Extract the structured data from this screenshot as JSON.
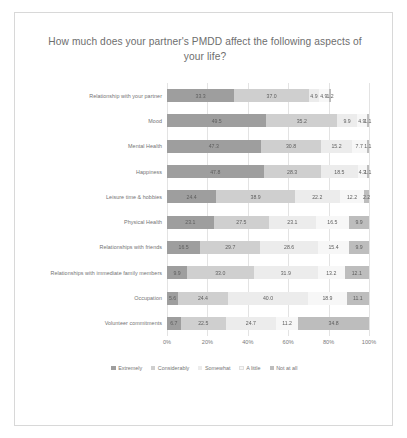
{
  "chart_data": {
    "type": "bar",
    "subtype": "100% stacked horizontal bar",
    "title": "How much does your partner's PMDD affect the following aspects of your life?",
    "xlabel": "",
    "ylabel": "",
    "xlim": [
      0,
      100
    ],
    "xticks": [
      "0%",
      "20%",
      "40%",
      "60%",
      "80%",
      "100%"
    ],
    "xtick_values": [
      0,
      20,
      40,
      60,
      80,
      100
    ],
    "grid": true,
    "legend_position": "bottom",
    "legend": [
      "Extremely",
      "Considerably",
      "Somewhat",
      "A little",
      "Not at all"
    ],
    "categories": [
      "Relationship with your partner",
      "Mood",
      "Mental Health",
      "Happiness",
      "Leisure time & hobbies",
      "Physical Health",
      "Relationships with friends",
      "Relationships with immediate family members",
      "Occupation",
      "Volunteer commitments"
    ],
    "series": [
      {
        "name": "Extremely",
        "color": "#9e9e9e",
        "values": [
          33.3,
          49.5,
          47.3,
          47.8,
          24.4,
          23.1,
          16.5,
          9.9,
          5.6,
          6.7
        ]
      },
      {
        "name": "Considerably",
        "color": "#cfcfcf",
        "values": [
          37.0,
          35.2,
          30.8,
          28.3,
          38.9,
          27.5,
          29.7,
          33.0,
          24.4,
          22.5
        ]
      },
      {
        "name": "Somewhat",
        "color": "#ececec",
        "values": [
          4.9,
          9.9,
          15.2,
          18.5,
          22.2,
          23.1,
          28.6,
          31.9,
          40.0,
          24.7
        ]
      },
      {
        "name": "A little",
        "color": "#f7f7f7",
        "values": [
          4.9,
          4.9,
          7.7,
          4.3,
          12.2,
          16.5,
          15.4,
          13.2,
          18.9,
          11.2
        ]
      },
      {
        "name": "Not at all",
        "color": "#bdbdbd",
        "values": [
          1.2,
          1.1,
          1.1,
          1.1,
          2.2,
          9.9,
          9.9,
          12.1,
          11.1,
          34.8
        ]
      }
    ]
  }
}
